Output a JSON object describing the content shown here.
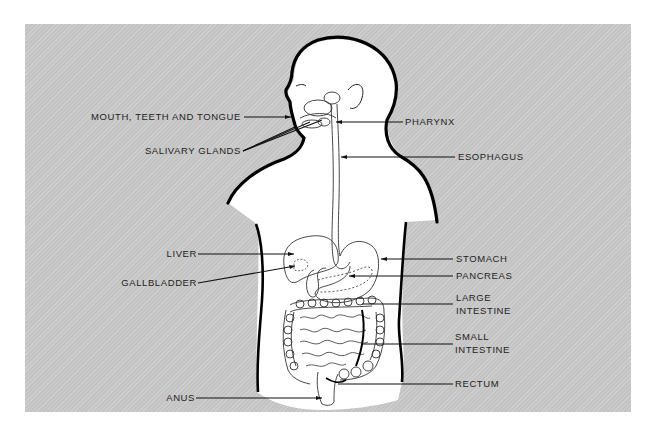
{
  "diagram": {
    "background_color": "#c9c9c9",
    "body_color": "#ffffff",
    "outline_color": "#000000",
    "labels_left": [
      {
        "id": "mouth",
        "text": "MOUTH, TEETH AND TONGUE"
      },
      {
        "id": "salivary",
        "text": "SALIVARY GLANDS"
      },
      {
        "id": "liver",
        "text": "LIVER"
      },
      {
        "id": "gallbladder",
        "text": "GALLBLADDER"
      },
      {
        "id": "anus",
        "text": "ANUS"
      }
    ],
    "labels_right": [
      {
        "id": "pharynx",
        "text": "PHARYNX"
      },
      {
        "id": "esophagus",
        "text": "ESOPHAGUS"
      },
      {
        "id": "stomach",
        "text": "STOMACH"
      },
      {
        "id": "pancreas",
        "text": "PANCREAS"
      },
      {
        "id": "large_intestine",
        "line1": "LARGE",
        "line2": "INTESTINE"
      },
      {
        "id": "small_intestine",
        "line1": "SMALL",
        "line2": "INTESTINE"
      },
      {
        "id": "rectum",
        "text": "RECTUM"
      }
    ]
  }
}
